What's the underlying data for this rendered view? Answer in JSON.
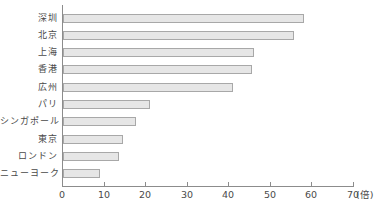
{
  "chart_data": {
    "type": "bar",
    "orientation": "horizontal",
    "title": "",
    "xlabel": "(倍)",
    "ylabel": "",
    "categories": [
      "深圳",
      "北京",
      "上海",
      "香港",
      "広州",
      "パリ",
      "シンガポール",
      "東京",
      "ロンドン",
      "ニューヨーク"
    ],
    "values": [
      58,
      55.5,
      46,
      45.5,
      41,
      21,
      17.5,
      14.5,
      13.5,
      9
    ],
    "xlim": [
      0,
      70
    ],
    "xticks": [
      0,
      10,
      20,
      30,
      40,
      50,
      60,
      70
    ],
    "grid": false,
    "legend_position": "none",
    "colors": {
      "bar_fill": "#e6e6e6",
      "bar_border": "#a8a8a8",
      "axis": "#8c8c8c",
      "text": "#4a4a4a",
      "background": "#ffffff"
    }
  }
}
